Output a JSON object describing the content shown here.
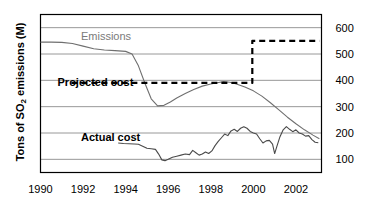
{
  "chart_data": {
    "type": "line",
    "title": "",
    "xlabel": "",
    "ylabel": "Tons of SO2 emissions (M)",
    "ylabel_prefix": "Tons of SO",
    "ylabel_sub": "2",
    "ylabel_suffix": " emissions (M)",
    "grid": true,
    "legend_position": "inline-annotations",
    "xlim": [
      1990,
      2003.2
    ],
    "ylim": [
      50,
      650
    ],
    "yticks": [
      100,
      200,
      300,
      400,
      500,
      600
    ],
    "ytick_labels": [
      "100",
      "200",
      "300",
      "400",
      "500",
      "600"
    ],
    "ytick_side": "right",
    "xticks": [
      1990,
      1992,
      1994,
      1996,
      1998,
      2000,
      2002
    ],
    "xtick_labels": [
      "1990",
      "1992",
      "1994",
      "1996",
      "1998",
      "2000",
      "2002"
    ],
    "annotations": [
      {
        "name": "emissions-label",
        "text": "Emissions",
        "x": 1991.9,
        "y": 570,
        "color": "#7a7a7a",
        "bold": false
      },
      {
        "name": "projected-cost-label",
        "text": "Projected cost",
        "x": 1990.8,
        "y": 392,
        "color": "#000000",
        "bold": true
      },
      {
        "name": "actual-cost-label",
        "text": "Actual cost",
        "x": 1991.9,
        "y": 185,
        "color": "#000000",
        "bold": true
      }
    ],
    "series": [
      {
        "name": "Emissions",
        "style": "solid",
        "color": "#6f6f6f",
        "x": [
          1990.0,
          1990.5,
          1991.0,
          1991.5,
          1992.0,
          1992.5,
          1993.0,
          1993.5,
          1994.0,
          1994.3,
          1994.6,
          1994.9,
          1995.2,
          1995.5,
          1995.8,
          1996.1,
          1996.4,
          1996.8,
          1997.2,
          1997.6,
          1998.0,
          1998.3,
          1998.6,
          1998.9,
          1999.2,
          1999.6,
          2000.0,
          2000.4,
          2000.8,
          2001.2,
          2001.6,
          2002.0,
          2002.4,
          2002.8,
          2003.1
        ],
        "values": [
          545,
          545,
          544,
          540,
          530,
          520,
          515,
          513,
          510,
          500,
          455,
          390,
          330,
          303,
          305,
          318,
          333,
          350,
          365,
          378,
          386,
          391,
          395,
          393,
          386,
          375,
          360,
          340,
          315,
          288,
          260,
          235,
          212,
          192,
          178
        ]
      },
      {
        "name": "Projected cost",
        "style": "dashed",
        "color": "#000000",
        "x": [
          1991.45,
          1993.0,
          1995.0,
          1997.0,
          1999.0,
          1999.95,
          1999.95,
          2000.05,
          2001.0,
          2002.0,
          2003.1
        ],
        "values": [
          390,
          390,
          390,
          390,
          390,
          390,
          550,
          550,
          550,
          550,
          550
        ]
      },
      {
        "name": "Actual cost",
        "style": "solid",
        "color": "#4a4a4a",
        "x": [
          1993.65,
          1993.9,
          1994.15,
          1994.4,
          1994.6,
          1994.8,
          1995.0,
          1995.2,
          1995.4,
          1995.55,
          1995.7,
          1995.85,
          1996.0,
          1996.2,
          1996.4,
          1996.6,
          1996.8,
          1997.0,
          1997.15,
          1997.3,
          1997.45,
          1997.6,
          1997.75,
          1997.9,
          1998.05,
          1998.2,
          1998.35,
          1998.5,
          1998.65,
          1998.8,
          1998.95,
          1999.1,
          1999.25,
          1999.4,
          1999.55,
          1999.7,
          1999.85,
          2000.0,
          2000.15,
          2000.3,
          2000.45,
          2000.6,
          2000.75,
          2000.9,
          2001.0,
          2001.1,
          2001.25,
          2001.4,
          2001.55,
          2001.7,
          2001.85,
          2002.0,
          2002.15,
          2002.3,
          2002.45,
          2002.6,
          2002.75,
          2002.9,
          2003.05
        ],
        "values": [
          162,
          160,
          159,
          158,
          157,
          150,
          142,
          140,
          138,
          120,
          98,
          95,
          100,
          108,
          112,
          116,
          120,
          118,
          134,
          125,
          116,
          120,
          128,
          122,
          132,
          152,
          168,
          182,
          196,
          190,
          208,
          214,
          206,
          218,
          224,
          218,
          206,
          200,
          196,
          178,
          162,
          170,
          172,
          158,
          122,
          148,
          186,
          212,
          224,
          214,
          205,
          212,
          200,
          196,
          188,
          190,
          175,
          165,
          163
        ]
      }
    ]
  }
}
